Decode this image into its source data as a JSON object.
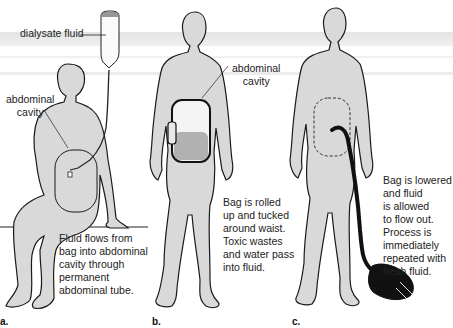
{
  "figure": {
    "colors": {
      "body_fill": "#d9d9d9",
      "outline": "#1a1a1a",
      "background": "#ffffff",
      "tube": "#111111"
    },
    "panels": [
      {
        "letter": "a.",
        "labels": {
          "bag": "dialysate fluid",
          "cavity": "abdominal\ncavity"
        },
        "caption": "Fluid flows from\nbag into abdominal\ncavity through\npermanent\nabdominal tube."
      },
      {
        "letter": "b.",
        "labels": {
          "cavity": "abdominal\ncavity"
        },
        "caption": "Bag is rolled\nup and tucked\naround waist.\nToxic wastes\nand water pass\ninto fluid."
      },
      {
        "letter": "c.",
        "caption": "Bag is lowered\nand fluid\nis allowed\nto flow out.\nProcess is\nimmediately\nrepeated with\nfresh fluid."
      }
    ]
  }
}
